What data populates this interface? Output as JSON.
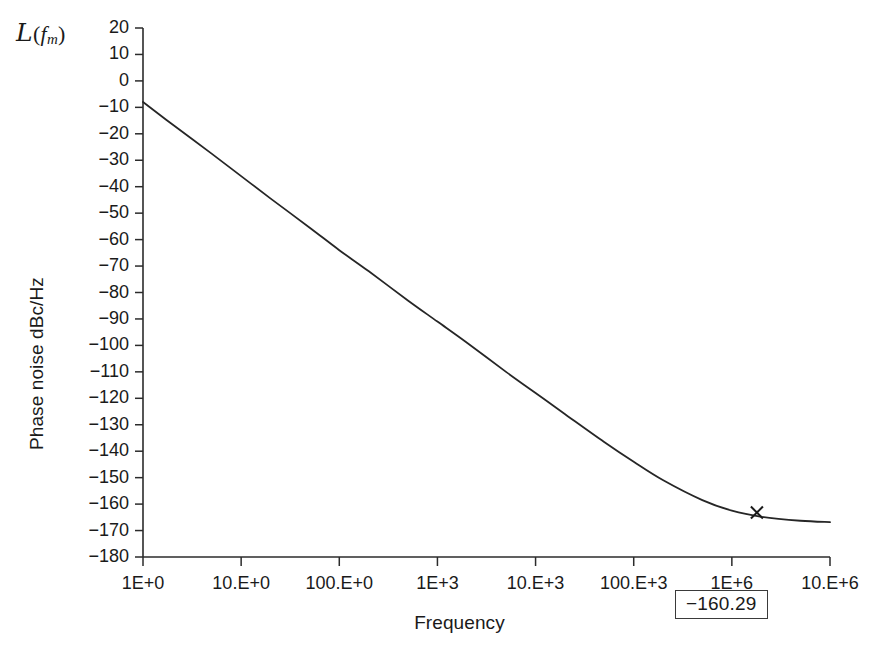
{
  "chart_data": {
    "type": "line",
    "title": "",
    "subtitle": "",
    "corner_label": {
      "symbol": "L",
      "open_paren": "(",
      "variable": "f",
      "subscript": "m",
      "close_paren": ")",
      "meaning": "script-L of f_m"
    },
    "xlabel": "Frequency",
    "ylabel": "Phase noise dBc/Hz",
    "x_scale": "log",
    "y_scale": "linear",
    "grid": false,
    "legend": "none",
    "xlim": [
      1,
      10000000
    ],
    "ylim": [
      -180,
      20
    ],
    "x_tick_values": [
      1,
      10,
      100,
      1000,
      10000,
      100000,
      1000000,
      10000000
    ],
    "x_tick_labels": [
      "1E+0",
      "10.E+0",
      "100.E+0",
      "1E+3",
      "10.E+3",
      "100.E+3",
      "1E+6",
      "10.E+6"
    ],
    "y_tick_labels": [
      "20",
      "10",
      "0",
      "−10",
      "−20",
      "−30",
      "−40",
      "−50",
      "−60",
      "−70",
      "−80",
      "−90",
      "−100",
      "−110",
      "−120",
      "−130",
      "−140",
      "−150",
      "−160",
      "−170",
      "−180"
    ],
    "y_tick_values": [
      20,
      10,
      0,
      -10,
      -20,
      -30,
      -40,
      -50,
      -60,
      -70,
      -80,
      -90,
      -100,
      -110,
      -120,
      -130,
      -140,
      -150,
      -160,
      -170,
      -180
    ],
    "series": [
      {
        "name": "Phase noise",
        "color": "#262626",
        "x": [
          1,
          2,
          5,
          10,
          20,
          50,
          100,
          200,
          500,
          1000,
          2000,
          5000,
          10000,
          20000,
          50000,
          100000,
          200000,
          500000,
          1000000,
          2000000,
          5000000,
          10000000
        ],
        "y": [
          -8,
          -16.5,
          -27.5,
          -36,
          -44.5,
          -55.5,
          -64,
          -72,
          -83,
          -91,
          -99,
          -110,
          -118,
          -126,
          -136.5,
          -144,
          -151,
          -158.5,
          -162.5,
          -164.8,
          -166.3,
          -166.8
        ]
      }
    ],
    "markers": [
      {
        "name": "cursor-marker",
        "glyph": "x",
        "x": 1800000,
        "y": -163.2,
        "label": "−160.29"
      }
    ],
    "annotations": [
      {
        "name": "readout-box",
        "text": "−160.29",
        "boxed": true
      }
    ]
  },
  "axis": {
    "line_color": "#2b2b2b"
  }
}
